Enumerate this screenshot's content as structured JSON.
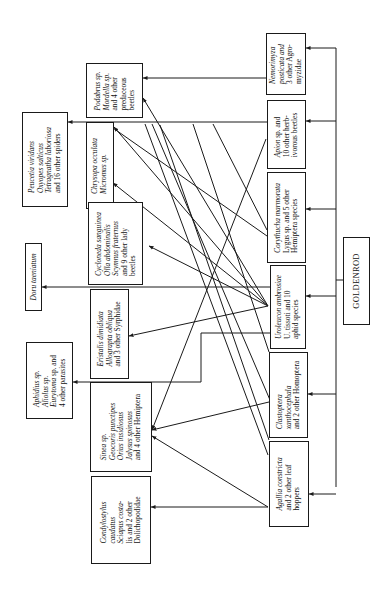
{
  "diagram": {
    "orientation": "rotated 90 degrees counter-clockwise (text reads bottom-to-top)",
    "root": {
      "id": "goldenrod",
      "label": "GOLDENROD"
    },
    "herbivores": [
      {
        "id": "nemorimyza",
        "lines": [
          "Nemorimyza",
          "posticata and",
          "3 other Agro-",
          "myzidae"
        ],
        "italic_lines": [
          0
        ]
      },
      {
        "id": "apion",
        "lines": [
          "Apion sp. and",
          "10 other herb-",
          "ivorous beetles"
        ],
        "italic_lines": []
      },
      {
        "id": "corythucha",
        "lines": [
          "Corythucha marmorata",
          "Lygus sp. and 5 other",
          "Hemiptera species"
        ],
        "italic_lines": [
          0
        ]
      },
      {
        "id": "uroleucon",
        "lines": [
          "Uroleucon ambrosiae",
          "U. tissoti and 10",
          "aphid species"
        ],
        "italic_lines": [
          0
        ]
      },
      {
        "id": "clastoptera",
        "lines": [
          "Clastoptera",
          "xanthocephala",
          "and 2 other Homoptera"
        ],
        "italic_lines": [
          0,
          1
        ]
      },
      {
        "id": "agallia",
        "lines": [
          "Agallia constricta",
          "and 2 other leaf",
          "hoppers"
        ],
        "italic_lines": [
          0
        ]
      }
    ],
    "predators": [
      {
        "id": "podabrus",
        "lines": [
          "Podabrus sp.",
          "Mordella sp.",
          "and 4 other",
          "predaceous",
          "beetles"
        ],
        "italic_lines": [
          0,
          1
        ]
      },
      {
        "id": "chrysopa",
        "lines": [
          "Chrysopa occulata",
          "Micromus sp."
        ],
        "italic_lines": [
          0,
          1
        ]
      },
      {
        "id": "cycloneda",
        "lines": [
          "Cycloneda sanguinea",
          "Olla abdominalis",
          "Scymnus fraternus",
          "and 9 other lady",
          "beetles"
        ],
        "italic_lines": [
          0,
          1,
          2
        ]
      },
      {
        "id": "eristalis",
        "lines": [
          "Eristalis dimidiata",
          "Allograpta obliqua",
          "and 3 other Syrphidae"
        ],
        "italic_lines": [
          0,
          1
        ]
      },
      {
        "id": "sinea",
        "lines": [
          "Sinea sp.",
          "Geocoris punctipes",
          "Orius insidiosus",
          "Jalysus spinosus",
          "and 4 other Hemiptera"
        ],
        "italic_lines": [
          0,
          1,
          2,
          3
        ]
      },
      {
        "id": "condylostylus",
        "lines": [
          "Condylostylus",
          "caudatus",
          "Sciapus costa-",
          "lis and 2 other",
          "Dolichopodidae"
        ],
        "italic_lines": [
          0,
          1,
          2,
          3
        ]
      }
    ],
    "top_predators": [
      {
        "id": "peucetia",
        "lines": [
          "Peucetia viridans",
          "Oxyopes salticus",
          "Tetragnatha laboriosa",
          "and 16 other spiders"
        ],
        "italic_lines": [
          0,
          1,
          2
        ]
      },
      {
        "id": "doru",
        "lines": [
          "Doru taeniatum"
        ],
        "italic_lines": [
          0
        ]
      },
      {
        "id": "aphidius",
        "lines": [
          "Aphidius sp.",
          "Aliolus sp.",
          "Eurytoma sp. and",
          "4 other parasites"
        ],
        "italic_lines": [
          0,
          1,
          2
        ]
      }
    ]
  }
}
